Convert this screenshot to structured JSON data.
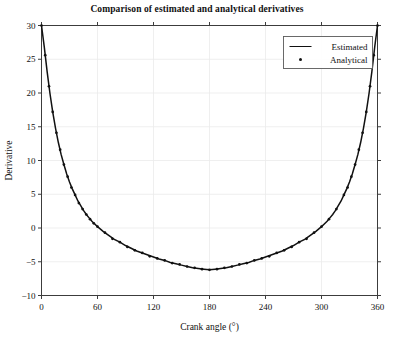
{
  "chart_data": {
    "type": "line",
    "title": "Comparison of estimated and analytical derivatives",
    "xlabel": "Crank angle (°)",
    "ylabel": "Derivative",
    "xlim": [
      0,
      360
    ],
    "ylim": [
      -10,
      30
    ],
    "xticks": [
      0,
      60,
      120,
      180,
      240,
      300,
      360
    ],
    "yticks": [
      -10,
      -5,
      0,
      5,
      10,
      15,
      20,
      25,
      30
    ],
    "grid": true,
    "legend_position": "upper right",
    "legend": [
      "Estimated",
      "Analytical"
    ],
    "series": [
      {
        "name": "Estimated",
        "style": "line",
        "color": "#111111",
        "x": [
          0,
          3,
          6,
          9,
          12,
          15,
          18,
          21,
          24,
          27,
          30,
          33,
          36,
          39,
          42,
          45,
          48,
          51,
          54,
          57,
          60,
          66,
          72,
          78,
          84,
          90,
          96,
          102,
          108,
          114,
          120,
          126,
          132,
          138,
          144,
          150,
          156,
          162,
          168,
          174,
          180,
          186,
          192,
          198,
          204,
          210,
          216,
          222,
          228,
          234,
          240,
          246,
          252,
          258,
          264,
          270,
          276,
          282,
          288,
          294,
          300,
          303,
          306,
          309,
          312,
          315,
          318,
          321,
          324,
          327,
          330,
          333,
          336,
          339,
          342,
          345,
          348,
          351,
          354,
          357,
          360
        ],
        "y": [
          30.0,
          26.8,
          23.2,
          20.0,
          17.2,
          14.8,
          12.7,
          10.9,
          9.4,
          8.0,
          6.8,
          5.8,
          4.9,
          4.0,
          3.3,
          2.6,
          2.0,
          1.5,
          1.0,
          0.6,
          0.2,
          -0.5,
          -1.1,
          -1.7,
          -2.1,
          -2.6,
          -3.0,
          -3.4,
          -3.7,
          -4.0,
          -4.3,
          -4.6,
          -4.8,
          -5.1,
          -5.3,
          -5.5,
          -5.7,
          -5.9,
          -6.0,
          -6.1,
          -6.2,
          -6.1,
          -6.0,
          -5.9,
          -5.7,
          -5.5,
          -5.3,
          -5.1,
          -4.8,
          -4.6,
          -4.3,
          -4.0,
          -3.7,
          -3.4,
          -3.0,
          -2.6,
          -2.1,
          -1.7,
          -1.1,
          -0.5,
          0.2,
          0.6,
          1.0,
          1.5,
          2.0,
          2.6,
          3.3,
          4.0,
          4.9,
          5.8,
          6.8,
          8.0,
          9.4,
          10.9,
          12.7,
          14.8,
          17.2,
          20.0,
          23.2,
          26.8,
          30.0
        ]
      },
      {
        "name": "Analytical",
        "style": "markers",
        "color": "#111111",
        "x": [
          0,
          4,
          8,
          12,
          16,
          20,
          24,
          28,
          32,
          36,
          40,
          44,
          48,
          52,
          56,
          60,
          68,
          76,
          84,
          92,
          100,
          108,
          116,
          124,
          132,
          140,
          148,
          156,
          164,
          172,
          180,
          188,
          196,
          204,
          212,
          220,
          228,
          236,
          244,
          252,
          260,
          268,
          276,
          284,
          292,
          300,
          308,
          316,
          324,
          328,
          332,
          336,
          340,
          344,
          348,
          352,
          356,
          360
        ],
        "y": [
          30.0,
          25.6,
          21.0,
          17.2,
          14.1,
          11.6,
          9.4,
          7.6,
          6.0,
          4.9,
          3.7,
          2.8,
          2.0,
          1.3,
          0.7,
          0.2,
          -0.7,
          -1.6,
          -2.1,
          -2.8,
          -3.3,
          -3.7,
          -4.2,
          -4.5,
          -4.8,
          -5.2,
          -5.4,
          -5.7,
          -5.9,
          -6.1,
          -6.2,
          -6.1,
          -5.9,
          -5.7,
          -5.4,
          -5.2,
          -4.8,
          -4.5,
          -4.2,
          -3.7,
          -3.3,
          -2.8,
          -2.1,
          -1.6,
          -0.7,
          0.2,
          1.3,
          2.8,
          4.9,
          6.0,
          7.6,
          9.4,
          11.6,
          14.1,
          17.2,
          21.0,
          25.6,
          30.0
        ]
      }
    ]
  }
}
